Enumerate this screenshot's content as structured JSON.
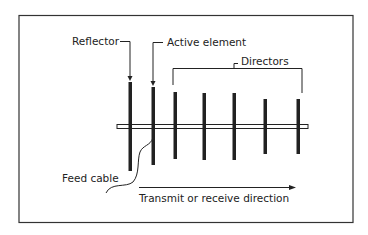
{
  "diagram": {
    "labels": {
      "reflector": "Reflector",
      "active_element": "Active element",
      "directors": "Directors",
      "feed_cable": "Feed cable",
      "direction": "Transmit or receive direction"
    },
    "elements": [
      {
        "name": "reflector",
        "x": 130,
        "top": 82,
        "bottom": 171
      },
      {
        "name": "active-element",
        "x": 153,
        "top": 87,
        "bottom": 165
      },
      {
        "name": "director-1",
        "x": 175,
        "top": 92,
        "bottom": 159
      },
      {
        "name": "director-2",
        "x": 204,
        "top": 93,
        "bottom": 160
      },
      {
        "name": "director-3",
        "x": 234,
        "top": 93,
        "bottom": 160
      },
      {
        "name": "director-4",
        "x": 265,
        "top": 99,
        "bottom": 154
      },
      {
        "name": "director-5",
        "x": 298,
        "top": 99,
        "bottom": 154
      }
    ],
    "colors": {
      "stroke": "#222222",
      "frame": "#333333",
      "background": "#ffffff"
    }
  }
}
